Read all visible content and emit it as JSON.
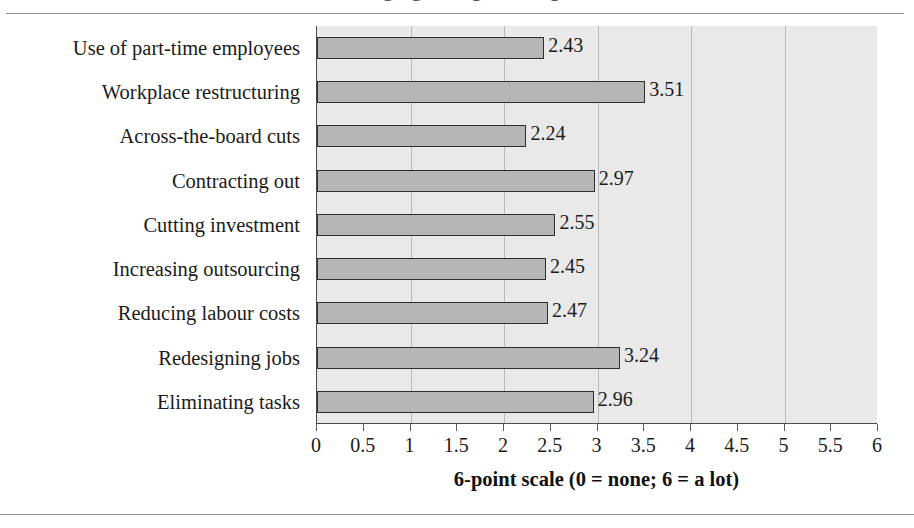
{
  "figure": {
    "clipped_title_fragment": "Managing change strategies",
    "axis_title": "6-point scale (0 = none; 6 = a lot)"
  },
  "chart_data": {
    "type": "bar",
    "orientation": "horizontal",
    "title": "",
    "xlabel": "6-point scale (0 = none; 6 = a lot)",
    "ylabel": "",
    "xlim": [
      0,
      6
    ],
    "grid": true,
    "legend": "none",
    "categories": [
      "Use of part-time employees",
      "Workplace restructuring",
      "Across-the-board cuts",
      "Contracting out",
      "Cutting investment",
      "Increasing outsourcing",
      "Reducing labour costs",
      "Redesigning jobs",
      "Eliminating tasks"
    ],
    "values": [
      2.43,
      3.51,
      2.24,
      2.97,
      2.55,
      2.45,
      2.47,
      3.24,
      2.96
    ],
    "value_labels": [
      "2.43",
      "3.51",
      "2.24",
      "2.97",
      "2.55",
      "2.45",
      "2.47",
      "3.24",
      "2.96"
    ],
    "xticks": [
      0,
      0.5,
      1,
      1.5,
      2,
      2.5,
      3,
      3.5,
      4,
      4.5,
      5,
      5.5,
      6
    ],
    "xtick_labels": [
      "0",
      "0.5",
      "1",
      "1.5",
      "2",
      "2.5",
      "3",
      "3.5",
      "4",
      "4.5",
      "5",
      "5.5",
      "6"
    ],
    "gridline_values": [
      1,
      2,
      3,
      4,
      5
    ],
    "colors": {
      "bar_fill": "#b6b6b6",
      "bar_border": "#2e2e2e",
      "plot_background": "#e9e9e9",
      "gridline": "#b9b9b9",
      "axis": "#4a4a4a",
      "text": "#1b1b1b"
    }
  }
}
